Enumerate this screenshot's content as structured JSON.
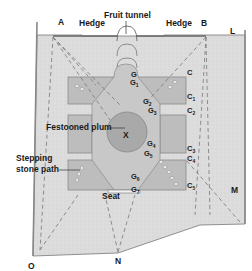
{
  "diagram": {
    "type": "garden-plan",
    "labels": {
      "title_top": "Fruit tunnel",
      "hedge_left": "Hedge",
      "hedge_right": "Hedge",
      "festooned_plum": "Festooned plum",
      "stepping_stone": "Stepping",
      "stepping_stone2": "stone path",
      "seat": "Seat"
    },
    "points": {
      "A": "A",
      "B": "B",
      "L": "L",
      "M": "M",
      "N": "N",
      "O": "O",
      "X": "X"
    },
    "c_points": [
      {
        "base": "C",
        "sub": ""
      },
      {
        "base": "C",
        "sub": "1"
      },
      {
        "base": "C",
        "sub": "2"
      },
      {
        "base": "C",
        "sub": "3"
      },
      {
        "base": "C",
        "sub": "4"
      },
      {
        "base": "C",
        "sub": "5"
      }
    ],
    "g_points": [
      {
        "base": "G",
        "sub": ""
      },
      {
        "base": "G",
        "sub": "1"
      },
      {
        "base": "G",
        "sub": "2"
      },
      {
        "base": "G",
        "sub": "3"
      },
      {
        "base": "G",
        "sub": "4"
      },
      {
        "base": "G",
        "sub": "5"
      },
      {
        "base": "G",
        "sub": "6"
      },
      {
        "base": "G",
        "sub": "7"
      }
    ],
    "colors": {
      "garden_fill": "#d9d9d9",
      "bed_fill": "#b8b8b8",
      "lawn_fill": "#a8a8a8",
      "line": "#555555",
      "text": "#1a1a1a"
    }
  }
}
